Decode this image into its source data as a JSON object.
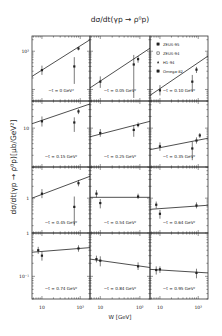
{
  "chart_data": {
    "type": "scatter",
    "title": "dσ/dt(γp → ρ⁰p)",
    "xlabel": "W [GeV]",
    "ylabel": "dσ/dt(γp → ρ⁰p)[μb/GeV²]",
    "xscale": "log",
    "yscale": "log",
    "xlim": [
      5.5,
      180
    ],
    "x_tick_labels": [
      "10",
      "10²"
    ],
    "legend": {
      "position": "top-right panel",
      "entries": [
        {
          "label": "ZEUS-95",
          "marker": "filled-square"
        },
        {
          "label": "ZEUS-94",
          "marker": "open-square"
        },
        {
          "label": "H1-94",
          "marker": "filled-triangle"
        },
        {
          "label": "Omega-82",
          "marker": "filled-square"
        }
      ]
    },
    "rows": [
      {
        "ylim": [
          5,
          250
        ],
        "y_tick_labels": [
          {
            "text": "10²",
            "value": 100
          }
        ]
      },
      {
        "ylim": [
          1,
          50
        ],
        "y_tick_labels": [
          {
            "text": "10",
            "value": 10
          }
        ]
      },
      {
        "ylim": [
          0.13,
          6.2
        ],
        "y_tick_labels": [
          {
            "text": "1",
            "value": 1
          }
        ]
      },
      {
        "ylim": [
          0.03,
          1
        ],
        "y_tick_labels": [
          {
            "text": "1",
            "value": 1
          },
          {
            "text": "10⁻¹",
            "value": 0.1
          }
        ]
      }
    ],
    "panels": [
      {
        "label": "−t = 0 GeV²",
        "row": 0,
        "col": 0,
        "fit": [
          [
            5.5,
            22
          ],
          [
            180,
            200
          ]
        ],
        "points": [
          {
            "W": 10,
            "y": 32,
            "lo": 24,
            "hi": 42
          },
          {
            "W": 70,
            "y": 40,
            "lo": 14,
            "hi": 70
          },
          {
            "W": 90,
            "y": 118,
            "lo": 105,
            "hi": 130
          }
        ]
      },
      {
        "label": "−t = 0.05 GeV²",
        "row": 0,
        "col": 1,
        "fit": [
          [
            5.5,
            11
          ],
          [
            180,
            120
          ]
        ],
        "points": [
          {
            "W": 10,
            "y": 16,
            "lo": 11,
            "hi": 22
          },
          {
            "W": 70,
            "y": 45,
            "lo": 6,
            "hi": 80
          },
          {
            "W": 90,
            "y": 62,
            "lo": 50,
            "hi": 75
          }
        ]
      },
      {
        "label": "−t = 0.10 GeV²",
        "row": 0,
        "col": 2,
        "fit": [
          [
            5.5,
            7
          ],
          [
            180,
            75
          ]
        ],
        "points": [
          {
            "W": 10,
            "y": 9.5,
            "lo": 7,
            "hi": 13
          },
          {
            "W": 70,
            "y": 16,
            "lo": 9,
            "hi": 24
          },
          {
            "W": 90,
            "y": 33,
            "lo": 27,
            "hi": 39
          }
        ]
      },
      {
        "label": "−t = 0.15 GeV²",
        "row": 1,
        "col": 0,
        "fit": [
          [
            5.5,
            13
          ],
          [
            180,
            42
          ]
        ],
        "points": [
          {
            "W": 10,
            "y": 15,
            "lo": 11,
            "hi": 20
          },
          {
            "W": 70,
            "y": 14,
            "lo": 8,
            "hi": 19
          },
          {
            "W": 90,
            "y": 27,
            "lo": 23,
            "hi": 31
          }
        ]
      },
      {
        "label": "−t = 0.25 GeV²",
        "row": 1,
        "col": 1,
        "fit": [
          [
            5.5,
            6
          ],
          [
            180,
            15
          ]
        ],
        "points": [
          {
            "W": 10,
            "y": 7.5,
            "lo": 6,
            "hi": 9.5
          },
          {
            "W": 70,
            "y": 9,
            "lo": 6,
            "hi": 12
          },
          {
            "W": 90,
            "y": 12,
            "lo": 10.5,
            "hi": 14
          }
        ]
      },
      {
        "label": "−t = 0.35 GeV²",
        "row": 1,
        "col": 2,
        "fit": [
          [
            5.5,
            2.8
          ],
          [
            180,
            5.5
          ]
        ],
        "points": [
          {
            "W": 10,
            "y": 3.4,
            "lo": 2.6,
            "hi": 4.3
          },
          {
            "W": 70,
            "y": 3,
            "lo": 1.5,
            "hi": 4.5
          },
          {
            "W": 90,
            "y": 4.8,
            "lo": 4,
            "hi": 5.8
          },
          {
            "W": 110,
            "y": 6.5,
            "lo": 5.6,
            "hi": 7.5
          }
        ]
      },
      {
        "label": "−t = 0.45 GeV²",
        "row": 2,
        "col": 0,
        "fit": [
          [
            5.5,
            1.0
          ],
          [
            180,
            3.6
          ]
        ],
        "points": [
          {
            "W": 10,
            "y": 1.3,
            "lo": 1.0,
            "hi": 1.7
          },
          {
            "W": 70,
            "y": 0.6,
            "lo": 0.2,
            "hi": 1.1
          },
          {
            "W": 90,
            "y": 2.4,
            "lo": 2.0,
            "hi": 2.9
          }
        ]
      },
      {
        "label": "−t = 0.54 GeV²",
        "row": 2,
        "col": 1,
        "fit": [
          [
            5.5,
            1.05
          ],
          [
            180,
            1.05
          ]
        ],
        "points": [
          {
            "W": 8,
            "y": 1.3,
            "lo": 1.05,
            "hi": 1.6
          },
          {
            "W": 10,
            "y": 0.75,
            "lo": 0.55,
            "hi": 0.95
          },
          {
            "W": 90,
            "y": 1.1,
            "lo": 0.95,
            "hi": 1.3
          }
        ]
      },
      {
        "label": "−t = 0.64 GeV²",
        "row": 2,
        "col": 2,
        "fit": [
          [
            5.5,
            0.52
          ],
          [
            180,
            0.66
          ]
        ],
        "points": [
          {
            "W": 8,
            "y": 0.68,
            "lo": 0.55,
            "hi": 0.82
          },
          {
            "W": 10,
            "y": 0.4,
            "lo": 0.3,
            "hi": 0.5
          },
          {
            "W": 90,
            "y": 0.65,
            "lo": 0.55,
            "hi": 0.78
          }
        ]
      },
      {
        "label": "−t = 0.74 GeV²",
        "row": 3,
        "col": 0,
        "fit": [
          [
            5.5,
            0.36
          ],
          [
            180,
            0.46
          ]
        ],
        "points": [
          {
            "W": 8,
            "y": 0.4,
            "lo": 0.33,
            "hi": 0.48
          },
          {
            "W": 10,
            "y": 0.3,
            "lo": 0.23,
            "hi": 0.37
          },
          {
            "W": 90,
            "y": 0.44,
            "lo": 0.37,
            "hi": 0.52
          }
        ]
      },
      {
        "label": "−t = 0.84 GeV²",
        "row": 3,
        "col": 1,
        "fit": [
          [
            5.5,
            0.25
          ],
          [
            180,
            0.16
          ]
        ],
        "points": [
          {
            "W": 8,
            "y": 0.25,
            "lo": 0.21,
            "hi": 0.3
          },
          {
            "W": 10,
            "y": 0.23,
            "lo": 0.17,
            "hi": 0.29
          },
          {
            "W": 90,
            "y": 0.17,
            "lo": 0.14,
            "hi": 0.21
          }
        ]
      },
      {
        "label": "−t = 0.95 GeV²",
        "row": 3,
        "col": 2,
        "fit": [
          [
            5.5,
            0.145
          ],
          [
            180,
            0.12
          ]
        ],
        "points": [
          {
            "W": 8,
            "y": 0.14,
            "lo": 0.11,
            "hi": 0.17
          },
          {
            "W": 10,
            "y": 0.145,
            "lo": 0.12,
            "hi": 0.17
          },
          {
            "W": 90,
            "y": 0.12,
            "lo": 0.09,
            "hi": 0.15
          }
        ]
      }
    ]
  }
}
